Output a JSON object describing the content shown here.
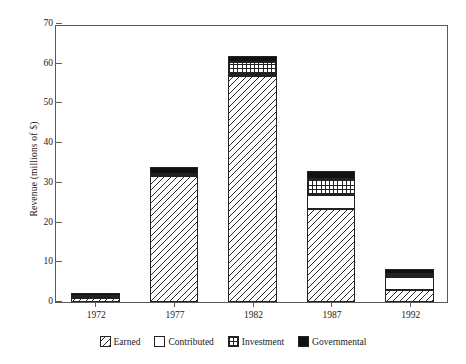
{
  "chart_data": {
    "type": "bar",
    "subtype": "stacked-bar",
    "title": "",
    "xlabel": "",
    "ylabel": "Revenue (millions of $)",
    "categories": [
      "1972",
      "1977",
      "1982",
      "1987",
      "1992"
    ],
    "series": [
      {
        "name": "Earned",
        "pattern": "diagonal-hatch",
        "values": [
          1.0,
          31.8,
          56.8,
          23.5,
          3.0
        ]
      },
      {
        "name": "Contributed",
        "pattern": "blank-white",
        "values": [
          0.3,
          0.3,
          0.6,
          3.5,
          3.2
        ]
      },
      {
        "name": "Investment",
        "pattern": "checkerboard",
        "values": [
          0.3,
          0.2,
          3.0,
          4.0,
          0.9
        ]
      },
      {
        "name": "Governmental",
        "pattern": "solid-black",
        "values": [
          0.6,
          1.7,
          1.5,
          2.1,
          1.2
        ]
      }
    ],
    "totals": [
      2.2,
      34.0,
      61.9,
      33.1,
      8.3
    ],
    "ylim": [
      0,
      70
    ],
    "yticks": [
      0,
      10,
      20,
      30,
      40,
      50,
      60,
      70
    ],
    "ytick_labels": [
      "0",
      "10",
      "20",
      "30",
      "40",
      "50",
      "60",
      "70"
    ],
    "xtick_labels": [
      "1972",
      "1977",
      "1982",
      "1987",
      "1992"
    ],
    "grid": false,
    "legend_position": "bottom",
    "colors": {
      "outline": "#222222",
      "axis": "#5a5a5a",
      "governmental": "#111111",
      "background": "#ffffff"
    }
  },
  "legend": {
    "items": [
      {
        "label": "Earned"
      },
      {
        "label": "Contributed"
      },
      {
        "label": "Investment"
      },
      {
        "label": "Governmental"
      }
    ]
  }
}
